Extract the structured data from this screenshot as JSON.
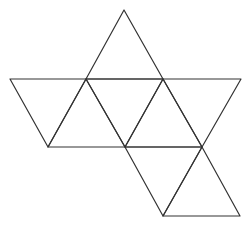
{
  "diagram": {
    "stroke_color": "#333333",
    "background": "#ffffff",
    "vertices": {
      "A": [
        124,
        10
      ],
      "B": [
        10,
        79
      ],
      "C": [
        86,
        79
      ],
      "D": [
        163,
        79
      ],
      "E": [
        241,
        79
      ],
      "F": [
        48,
        147
      ],
      "G": [
        125,
        147
      ],
      "H": [
        202,
        147
      ],
      "I": [
        163,
        216
      ],
      "J": [
        240,
        216
      ]
    },
    "triangles": [
      [
        "A",
        "C",
        "D"
      ],
      [
        "B",
        "C",
        "F"
      ],
      [
        "C",
        "F",
        "G"
      ],
      [
        "C",
        "D",
        "G"
      ],
      [
        "D",
        "G",
        "H"
      ],
      [
        "D",
        "E",
        "H"
      ],
      [
        "G",
        "H",
        "I"
      ],
      [
        "H",
        "I",
        "J"
      ]
    ]
  }
}
